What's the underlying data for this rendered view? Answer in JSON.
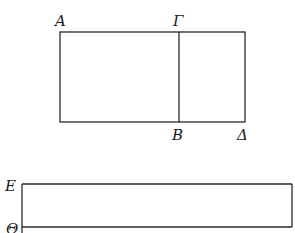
{
  "diagram": {
    "figure_top": {
      "points": {
        "A": "Α",
        "Gamma": "Γ",
        "B": "Β",
        "Delta": "Δ"
      },
      "segments": [
        "AΓ",
        "ΓΔ",
        "ΒΔ",
        "AΒ-left-side",
        "ΓΒ"
      ]
    },
    "figure_bottom": {
      "points": {
        "E": "Ε",
        "Theta": "Θ"
      }
    },
    "colors": {
      "stroke": "#2a2a2a",
      "background": "#ffffff"
    }
  }
}
